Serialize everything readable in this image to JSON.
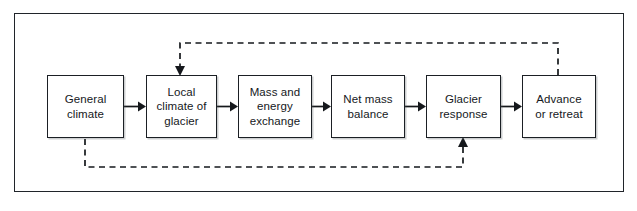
{
  "figure": {
    "type": "flowchart",
    "orientation": "horizontal",
    "frame": {
      "border_color": "#20242a",
      "background": "#ffffff"
    },
    "line_color": "#15181c"
  },
  "nodes": [
    {
      "id": "general-climate",
      "label": "General\nclimate"
    },
    {
      "id": "local-climate",
      "label": "Local\nclimate of\nglacier"
    },
    {
      "id": "mass-energy",
      "label": "Mass and\nenergy\nexchange"
    },
    {
      "id": "net-mass-balance",
      "label": "Net mass\nbalance"
    },
    {
      "id": "glacier-response",
      "label": "Glacier\nresponse"
    },
    {
      "id": "advance-or-retreat",
      "label": "Advance\nor retreat"
    }
  ],
  "edges": [
    {
      "id": "e1",
      "from": "general-climate",
      "to": "local-climate",
      "style": "solid",
      "direction": "right"
    },
    {
      "id": "e2",
      "from": "local-climate",
      "to": "mass-energy",
      "style": "solid",
      "direction": "right"
    },
    {
      "id": "e3",
      "from": "mass-energy",
      "to": "net-mass-balance",
      "style": "solid",
      "direction": "right"
    },
    {
      "id": "e4",
      "from": "net-mass-balance",
      "to": "glacier-response",
      "style": "solid",
      "direction": "right"
    },
    {
      "id": "e5",
      "from": "glacier-response",
      "to": "advance-or-retreat",
      "style": "solid",
      "direction": "right"
    },
    {
      "id": "f1",
      "from": "advance-or-retreat",
      "to": "local-climate",
      "style": "dashed",
      "direction": "down",
      "route": "over-top"
    },
    {
      "id": "f2",
      "from": "general-climate",
      "to": "glacier-response",
      "style": "dashed",
      "direction": "up",
      "route": "under-bottom"
    }
  ]
}
